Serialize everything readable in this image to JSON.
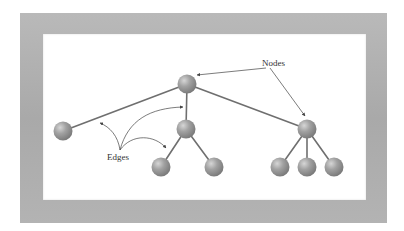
{
  "diagram": {
    "labels": {
      "nodes": "Nodes",
      "edges": "Edges"
    },
    "colors": {
      "frame": "#aeaeae",
      "background": "#ffffff",
      "node": "#9a9a9a",
      "edge": "#6f6f6f",
      "annotation": "#444444"
    },
    "nodes": [
      {
        "id": "root",
        "x": 187,
        "y": 84
      },
      {
        "id": "left",
        "x": 63,
        "y": 131
      },
      {
        "id": "middle",
        "x": 186,
        "y": 129
      },
      {
        "id": "right",
        "x": 307,
        "y": 129
      },
      {
        "id": "middle-child-1",
        "x": 161,
        "y": 167
      },
      {
        "id": "middle-child-2",
        "x": 214,
        "y": 167
      },
      {
        "id": "right-child-1",
        "x": 280,
        "y": 167
      },
      {
        "id": "right-child-2",
        "x": 307,
        "y": 167
      },
      {
        "id": "right-child-3",
        "x": 334,
        "y": 167
      }
    ],
    "edges": [
      [
        "root",
        "left"
      ],
      [
        "root",
        "middle"
      ],
      [
        "root",
        "right"
      ],
      [
        "middle",
        "middle-child-1"
      ],
      [
        "middle",
        "middle-child-2"
      ],
      [
        "right",
        "right-child-1"
      ],
      [
        "right",
        "right-child-2"
      ],
      [
        "right",
        "right-child-3"
      ]
    ]
  }
}
